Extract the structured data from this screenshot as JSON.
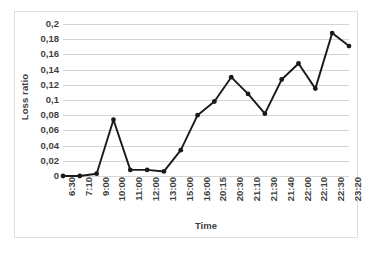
{
  "chart_data": {
    "type": "line",
    "title": "",
    "xlabel": "Time",
    "ylabel": "Loss ratio",
    "categories": [
      "6:30",
      "7:10",
      "9:00",
      "10:00",
      "11:00",
      "12:00",
      "13:00",
      "15:00",
      "16:00",
      "20:15",
      "20:30",
      "21:10",
      "21:30",
      "21:40",
      "22:00",
      "22:10",
      "22:30",
      "23:20"
    ],
    "values": [
      0.0,
      0.0,
      0.003,
      0.074,
      0.008,
      0.008,
      0.006,
      0.034,
      0.08,
      0.098,
      0.13,
      0.108,
      0.082,
      0.127,
      0.148,
      0.115,
      0.188,
      0.171
    ],
    "series": [
      {
        "name": "Loss ratio",
        "values": [
          0.0,
          0.0,
          0.003,
          0.074,
          0.008,
          0.008,
          0.006,
          0.034,
          0.08,
          0.098,
          0.13,
          0.108,
          0.082,
          0.127,
          0.148,
          0.115,
          0.188,
          0.171
        ]
      }
    ],
    "ylim": [
      0,
      0.2
    ],
    "ytick_values": [
      0,
      0.02,
      0.04,
      0.06,
      0.08,
      0.1,
      0.12,
      0.14,
      0.16,
      0.18,
      0.2
    ],
    "ytick_labels": [
      "0",
      "0,02",
      "0,04",
      "0,06",
      "0,08",
      "0,1",
      "0,12",
      "0,14",
      "0,16",
      "0,18",
      "0,2"
    ],
    "grid": true,
    "legend": false,
    "legend_position": "none",
    "decimal_separator": ",",
    "colors": {
      "line": "#1a1a1a",
      "marker": "#1a1a1a",
      "gridline": "#d4d4d4",
      "text": "#3f3f3f",
      "border": "#dedede",
      "background": "#ffffff"
    }
  }
}
